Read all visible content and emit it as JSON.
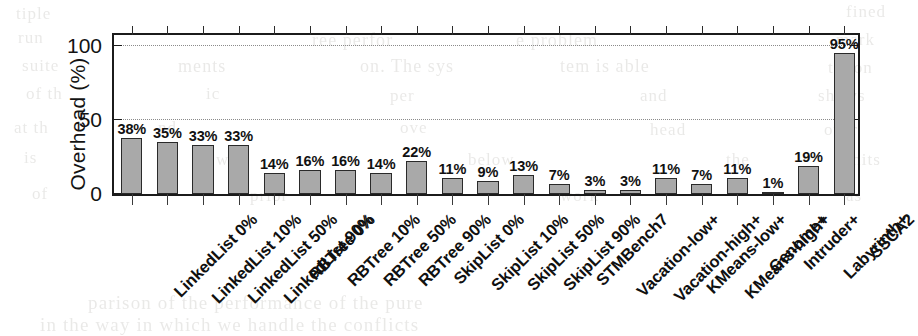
{
  "chart_data": {
    "type": "bar",
    "title": "",
    "xlabel": "",
    "ylabel": "Overhead (%)",
    "ylim": [
      0,
      110
    ],
    "yticks": [
      0,
      50,
      100
    ],
    "ytick_labels": [
      "0",
      "50",
      "100"
    ],
    "grid": "horizontal-dotted",
    "legend": "none",
    "value_label_suffix": "%",
    "categories": [
      "LinkedList 0%",
      "LinkedList 10%",
      "LinkedList 50%",
      "LinkedList 90%",
      "RBTree 0%",
      "RBTree 10%",
      "RBTree 50%",
      "RBTree 90%",
      "SkipList 0%",
      "SkipList 10%",
      "SkipList 50%",
      "SkipList 90%",
      "STMBench7",
      "Vacation-low+",
      "Vacation-high+",
      "KMeans-low+",
      "KMeans-high+",
      "Genome+",
      "Intruder+",
      "Labyrinth+",
      "SSCA2"
    ],
    "values": [
      38,
      35,
      33,
      33,
      14,
      16,
      16,
      14,
      22,
      11,
      9,
      13,
      7,
      3,
      3,
      11,
      7,
      11,
      1,
      19,
      95
    ],
    "value_labels": [
      "38%",
      "35%",
      "33%",
      "33%",
      "14%",
      "16%",
      "16%",
      "14%",
      "22%",
      "11%",
      "9%",
      "13%",
      "7%",
      "3%",
      "3%",
      "11%",
      "7%",
      "11%",
      "1%",
      "19%",
      "95%"
    ],
    "colors": {
      "bar_fill": "#a9a9a9",
      "bar_edge": "#2a2a2a",
      "axis": "#1b1b1b",
      "grid": "#8b8b8b",
      "text": "#111111",
      "background": "#ffffff"
    }
  },
  "background_ghost_text": [
    {
      "text": "tiple",
      "x": 16,
      "y": 4,
      "size": 17
    },
    {
      "text": "fined",
      "x": 846,
      "y": 2,
      "size": 17
    },
    {
      "text": "run",
      "x": 18,
      "y": 28,
      "size": 17
    },
    {
      "text": "ree perfor",
      "x": 312,
      "y": 30,
      "size": 18
    },
    {
      "text": "e problem",
      "x": 516,
      "y": 30,
      "size": 18
    },
    {
      "text": "mark",
      "x": 836,
      "y": 30,
      "size": 17
    },
    {
      "text": "suite",
      "x": 22,
      "y": 56,
      "size": 17
    },
    {
      "text": "ments",
      "x": 178,
      "y": 56,
      "size": 18
    },
    {
      "text": "on. The sys",
      "x": 360,
      "y": 56,
      "size": 18
    },
    {
      "text": "tem is able",
      "x": 560,
      "y": 56,
      "size": 18
    },
    {
      "text": "tation",
      "x": 828,
      "y": 58,
      "size": 17
    },
    {
      "text": "of th",
      "x": 26,
      "y": 84,
      "size": 17
    },
    {
      "text": "ic",
      "x": 206,
      "y": 84,
      "size": 17
    },
    {
      "text": "per",
      "x": 390,
      "y": 86,
      "size": 17
    },
    {
      "text": "and",
      "x": 640,
      "y": 86,
      "size": 17
    },
    {
      "text": "shows",
      "x": 818,
      "y": 86,
      "size": 17
    },
    {
      "text": "at th",
      "x": 14,
      "y": 118,
      "size": 17
    },
    {
      "text": "nd",
      "x": 158,
      "y": 118,
      "size": 17
    },
    {
      "text": "ove",
      "x": 400,
      "y": 118,
      "size": 17
    },
    {
      "text": "head",
      "x": 650,
      "y": 120,
      "size": 17
    },
    {
      "text": "over",
      "x": 824,
      "y": 120,
      "size": 17
    },
    {
      "text": "is",
      "x": 24,
      "y": 148,
      "size": 17
    },
    {
      "text": "well",
      "x": 216,
      "y": 150,
      "size": 17
    },
    {
      "text": "below",
      "x": 468,
      "y": 150,
      "size": 17
    },
    {
      "text": "the",
      "x": 726,
      "y": 150,
      "size": 17
    },
    {
      "text": "limits",
      "x": 836,
      "y": 150,
      "size": 17
    },
    {
      "text": "of",
      "x": 32,
      "y": 184,
      "size": 17
    },
    {
      "text": "prior",
      "x": 250,
      "y": 186,
      "size": 17
    },
    {
      "text": "work",
      "x": 560,
      "y": 186,
      "size": 17
    },
    {
      "text": "as",
      "x": 846,
      "y": 186,
      "size": 17
    },
    {
      "text": "parison of the performance of the pure",
      "x": 88,
      "y": 292,
      "size": 19
    },
    {
      "text": "in the way in which we handle the conflicts",
      "x": 40,
      "y": 314,
      "size": 19
    }
  ]
}
